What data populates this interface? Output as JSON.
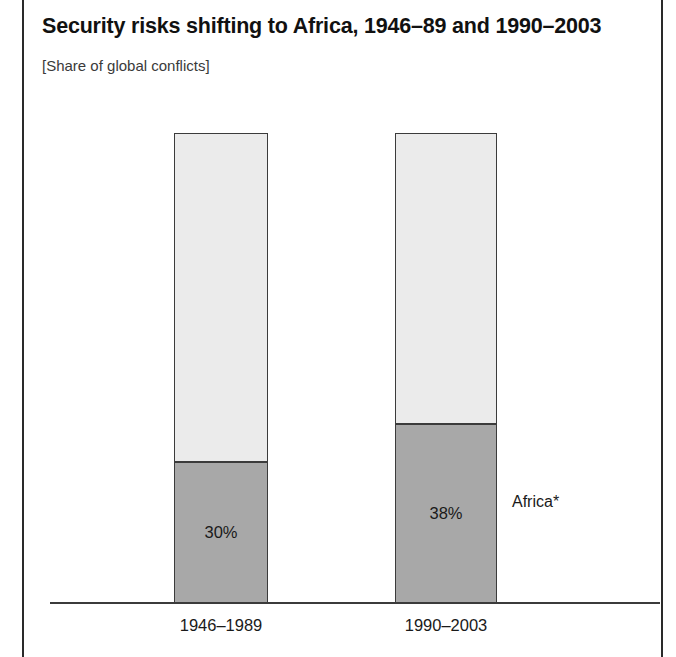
{
  "figure": {
    "title": "Security risks shifting to Africa, 1946–89 and 1990–2003",
    "subtitle": "[Share of global conflicts]",
    "series_label": "Africa*"
  },
  "chart_data": {
    "type": "bar",
    "title": "Security risks shifting to Africa, 1946–89 and 1990–2003",
    "subtitle": "[Share of global conflicts]",
    "xlabel": "",
    "ylabel": "",
    "ylim": [
      0,
      100
    ],
    "grid": false,
    "stacked": true,
    "legend_position": "right-inline",
    "categories": [
      "1946–1989",
      "1990–2003"
    ],
    "series": [
      {
        "name": "Africa*",
        "color": "#a8a8a8",
        "values": [
          30,
          38
        ],
        "value_labels": [
          "30%",
          "38%"
        ]
      },
      {
        "name": "Rest of world",
        "color": "#ebebeb",
        "values": [
          70,
          62
        ],
        "value_labels": [
          "",
          ""
        ]
      }
    ],
    "annotations": [
      {
        "text": "Africa*",
        "attached_to": "1990–2003",
        "side": "right"
      }
    ]
  },
  "bars": [
    {
      "category": "1946–1989",
      "value_label": "30%",
      "africa_pct": 30,
      "other_pct": 70
    },
    {
      "category": "1990–2003",
      "value_label": "38%",
      "africa_pct": 38,
      "other_pct": 62
    }
  ]
}
